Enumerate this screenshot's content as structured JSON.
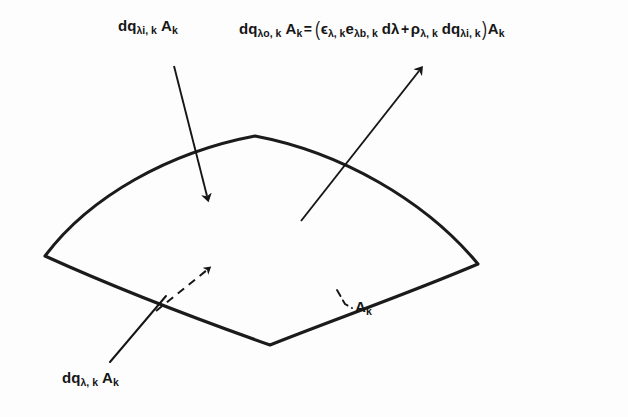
{
  "diagram": {
    "ink_color": "#161616",
    "background_color": "#fdfdfd"
  },
  "labels": {
    "incident": {
      "base": "dq",
      "sub": "λi, k",
      "area": "A",
      "area_sub": "k",
      "full_text": "dqλi, k Ak"
    },
    "outgoing": {
      "base": "dq",
      "sub": "λo, k",
      "area": "A",
      "area_sub": "k",
      "equals": "=",
      "open_paren": "(",
      "emissivity": "ϵ",
      "emissivity_sub": "λ, k",
      "blackbody": "e",
      "blackbody_sub": "λb, k",
      "dlambda": "dλ",
      "plus": "+",
      "reflectivity": "ρ",
      "reflectivity_sub": "λ, k",
      "incident": "dq",
      "incident_sub": "λi, k",
      "close_paren": ")",
      "trailing_area": "A",
      "trailing_area_sub": "k",
      "full_text": "dqλo, k Ak = (ϵλ, k eλb, k dλ + ρλ, k dqλi, k)Ak"
    },
    "net": {
      "base": "dq",
      "sub": "λ, k",
      "area": "A",
      "area_sub": "k",
      "full_text": "dqλ, k Ak"
    },
    "area": {
      "base": "A",
      "sub": "k",
      "full_text": "Ak"
    }
  },
  "geometry": {
    "patch_corners": [
      {
        "name": "left",
        "x": 45,
        "y": 256
      },
      {
        "name": "top",
        "x": 255,
        "y": 136
      },
      {
        "name": "right",
        "x": 478,
        "y": 264
      },
      {
        "name": "bottom",
        "x": 270,
        "y": 345
      }
    ],
    "arrows": [
      {
        "name": "incident-flux-arrow",
        "style": "solid",
        "from": [
          174,
          66
        ],
        "to": [
          207,
          196
        ]
      },
      {
        "name": "outgoing-flux-arrow",
        "style": "solid",
        "from": [
          301,
          221
        ],
        "to": [
          419,
          71
        ]
      },
      {
        "name": "net-flux-dashed-arrow",
        "style": "dashed",
        "from": [
          156,
          311
        ],
        "to": [
          207,
          270
        ]
      }
    ]
  }
}
